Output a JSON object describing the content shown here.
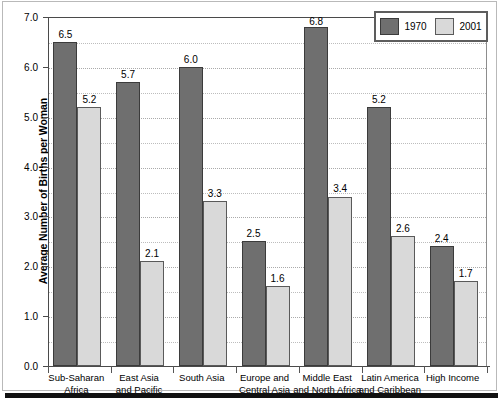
{
  "chart_data": {
    "type": "bar",
    "title": "",
    "xlabel": "",
    "ylabel": "Average Number of Births per Woman",
    "ylim": [
      0.0,
      7.0
    ],
    "ytick_step": 1.0,
    "gridline_step": 0.5,
    "grid": true,
    "legend_position": "top-right",
    "categories": [
      "Sub-Saharan Africa",
      "East Asia and Pacific",
      "South Asia",
      "Europe and Central Asia",
      "Middle East and North Africa",
      "Latin America and Caribbean",
      "High Income"
    ],
    "category_lines": [
      [
        "Sub-Saharan",
        "Africa"
      ],
      [
        "East Asia",
        "and Pacific"
      ],
      [
        "South Asia",
        ""
      ],
      [
        "Europe and",
        "Central Asia"
      ],
      [
        "Middle East",
        "and North Africa"
      ],
      [
        "Latin America",
        "and Caribbean"
      ],
      [
        "High Income",
        ""
      ]
    ],
    "series": [
      {
        "name": "1970",
        "color": "#6f6f6f",
        "values": [
          6.5,
          5.7,
          6.0,
          2.5,
          6.8,
          5.2,
          2.4
        ],
        "labels": [
          "6.5",
          "5.7",
          "6.0",
          "2.5",
          "6.8",
          "5.2",
          "2.4"
        ]
      },
      {
        "name": "2001",
        "color": "#d9d9d9",
        "values": [
          5.2,
          2.1,
          3.3,
          1.6,
          3.4,
          2.6,
          1.7
        ],
        "labels": [
          "5.2",
          "2.1",
          "3.3",
          "1.6",
          "3.4",
          "2.6",
          "1.7"
        ]
      }
    ],
    "ytick_labels": [
      "0.0",
      "1.0",
      "2.0",
      "3.0",
      "4.0",
      "5.0",
      "6.0",
      "7.0"
    ]
  },
  "legend": {
    "entries": [
      {
        "label": "1970"
      },
      {
        "label": "2001"
      }
    ]
  },
  "axis": {
    "y_title": "Average Number of Births per Woman"
  }
}
